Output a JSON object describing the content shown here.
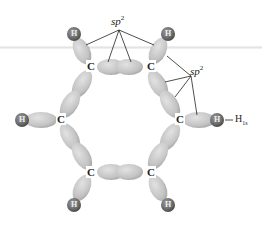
{
  "diagram": {
    "atoms": {
      "carbon_label": "C",
      "hydrogen_label": "H"
    },
    "labels": {
      "sp_top": "sp",
      "sp_top_sup": "2",
      "sp_right": "sp",
      "sp_right_sup": "2",
      "h_orbital": "H",
      "h_orbital_sub": "1s"
    },
    "colors": {
      "orbital": "#c8c8c8",
      "orbital_dark": "#a8a8a8",
      "hydrogen": "#707070",
      "hydrogen_dark": "#555555",
      "line": "#222222"
    }
  }
}
